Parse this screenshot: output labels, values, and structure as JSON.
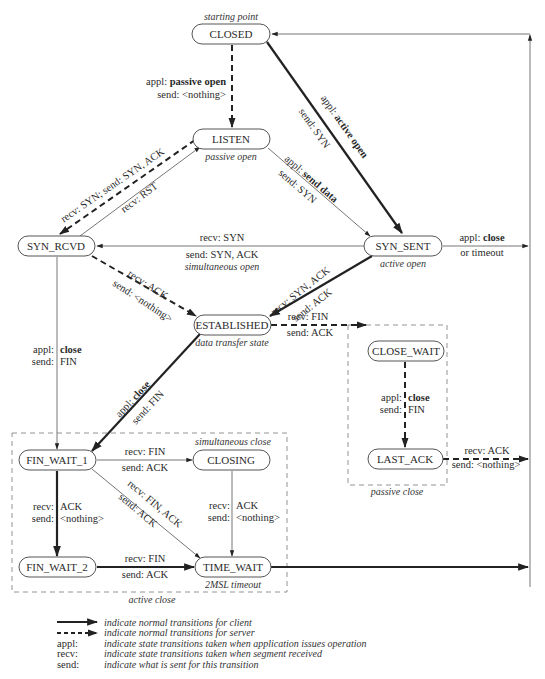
{
  "states": {
    "closed": "CLOSED",
    "listen": "LISTEN",
    "syn_rcvd": "SYN_RCVD",
    "syn_sent": "SYN_SENT",
    "established": "ESTABLISHED",
    "close_wait": "CLOSE_WAIT",
    "last_ack": "LAST_ACK",
    "fin_wait_1": "FIN_WAIT_1",
    "closing": "CLOSING",
    "fin_wait_2": "FIN_WAIT_2",
    "time_wait": "TIME_WAIT"
  },
  "notes": {
    "starting_point": "starting point",
    "passive_open": "passive open",
    "active_open": "active open",
    "simultaneous_open": "simultaneous open",
    "data_transfer_state": "data transfer state",
    "simultaneous_close": "simultaneous close",
    "two_msl_timeout": "2MSL timeout",
    "active_close": "active close",
    "passive_close": "passive close"
  },
  "transitions": {
    "closed_listen": {
      "appl_prefix": "appl: ",
      "appl": "passive open",
      "send": "send: <nothing>"
    },
    "closed_synsent": {
      "appl_prefix": "appl: ",
      "appl": "active open",
      "send": "send: SYN"
    },
    "listen_synrcvd": {
      "text": "recv: SYN;  send: SYN, ACK"
    },
    "synrcvd_listen": {
      "text": "recv: RST"
    },
    "listen_synsent": {
      "appl_prefix": "appl: ",
      "appl": "send data",
      "send": "send: SYN"
    },
    "synsent_synrcvd": {
      "recv": "recv: SYN",
      "send": "send: SYN, ACK"
    },
    "synsent_closed": {
      "appl_prefix": "appl: ",
      "appl": "close",
      "extra": "or timeout"
    },
    "synrcvd_established": {
      "recv": "recv: ACK",
      "send": "send: <nothing>"
    },
    "synsent_established": {
      "recv": "recv: SYN, ACK",
      "send": "send: ACK"
    },
    "synrcvd_finwait1": {
      "appl_prefix": "appl:",
      "appl": "close",
      "send_prefix": "send:",
      "send": "FIN"
    },
    "established_closewait": {
      "recv": "recv: FIN",
      "send": "send: ACK"
    },
    "established_finwait1": {
      "appl_prefix": "appl: ",
      "appl": "close",
      "send": "send: FIN"
    },
    "closewait_lastack": {
      "appl_prefix": "appl:",
      "appl": "close",
      "send_prefix": "send:",
      "send": "FIN"
    },
    "lastack_closed": {
      "recv": "recv: ACK",
      "send": "send: <nothing>"
    },
    "finwait1_closing": {
      "recv": "recv: FIN",
      "send": "send: ACK"
    },
    "finwait1_timewait": {
      "recv": "recv: FIN, ACK",
      "send": "send: ACK"
    },
    "finwait1_finwait2": {
      "recv_prefix": "recv:",
      "recv": "ACK",
      "send_prefix": "send:",
      "send": "<nothing>"
    },
    "closing_timewait": {
      "recv_prefix": "recv:",
      "recv": "ACK",
      "send_prefix": "send:",
      "send": "<nothing>"
    },
    "finwait2_timewait": {
      "recv": "recv: FIN",
      "send": "send: ACK"
    }
  },
  "legend": [
    {
      "key": "",
      "line": "solid",
      "text": "indicate normal transitions for client"
    },
    {
      "key": "",
      "line": "dashed",
      "text": "indicate normal transitions for server"
    },
    {
      "key": "appl:",
      "text": "indicate state transitions taken when application issues operation"
    },
    {
      "key": "recv:",
      "text": "indicate state transitions taken when segment received"
    },
    {
      "key": "send:",
      "text": "indicate what is sent for this transition"
    }
  ]
}
